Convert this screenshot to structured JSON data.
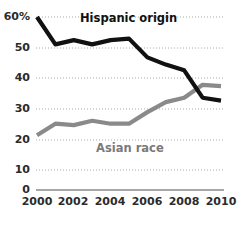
{
  "chart_data": {
    "type": "line",
    "title": "",
    "xlabel": "",
    "ylabel": "",
    "x": [
      2000,
      2001,
      2002,
      2003,
      2004,
      2005,
      2006,
      2007,
      2008,
      2009,
      2010
    ],
    "xlim": [
      2000,
      2010
    ],
    "ylim": [
      0,
      60
    ],
    "xtick_labels": [
      "2000",
      "2002",
      "2004",
      "2006",
      "2008",
      "2010"
    ],
    "xticks": [
      2000,
      2002,
      2004,
      2006,
      2008,
      2010
    ],
    "ytick_labels": [
      "60%",
      "50",
      "40",
      "30",
      "20",
      "10",
      "0"
    ],
    "yticks": [
      60,
      50,
      40,
      30,
      20,
      10,
      0
    ],
    "grid": true,
    "grid_style": "dotted-horizontal",
    "legend": "inline-labels",
    "series": [
      {
        "name": "Hispanic origin",
        "color": "#111111",
        "values": [
          60,
          50.5,
          52,
          50.5,
          52,
          52.5,
          46,
          43.5,
          41.5,
          32,
          31
        ]
      },
      {
        "name": "Asian race",
        "color": "#8a8a8a",
        "values": [
          19,
          23,
          22.5,
          24,
          23,
          23,
          27,
          30.5,
          32,
          36.5,
          36
        ]
      }
    ],
    "annotations": [
      {
        "text": "Hispanic origin",
        "color": "#111111"
      },
      {
        "text": "Asian race",
        "color": "#7a7a7a"
      }
    ]
  },
  "axis": {
    "y_labels": [
      {
        "text": "60%",
        "value": 60
      },
      {
        "text": "50",
        "value": 50
      },
      {
        "text": "40",
        "value": 40
      },
      {
        "text": "30",
        "value": 30
      },
      {
        "text": "20",
        "value": 20
      },
      {
        "text": "10",
        "value": 10
      },
      {
        "text": "0",
        "value": 0
      }
    ],
    "x_labels": [
      {
        "text": "2000",
        "value": 2000
      },
      {
        "text": "2002",
        "value": 2002
      },
      {
        "text": "2004",
        "value": 2004
      },
      {
        "text": "2006",
        "value": 2006
      },
      {
        "text": "2008",
        "value": 2008
      },
      {
        "text": "2010",
        "value": 2010
      }
    ]
  },
  "colors": {
    "hispanic_line": "#111111",
    "asian_line": "#8a8a8a",
    "gridline": "#aaaaaa",
    "axis_line": "#8a8a8a",
    "background": "#ffffff",
    "tick_text": "#2b2b2b"
  }
}
